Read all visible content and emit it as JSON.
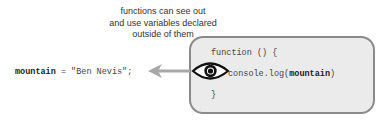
{
  "caption": {
    "line1": "functions can see out",
    "line2": "and use variables declared",
    "line3": "outside of them"
  },
  "outer": {
    "var_name": "mountain",
    "rest": " = \"Ben Nevis\";"
  },
  "function_box": {
    "header": "function () {",
    "body_prefix": "console.log(",
    "body_var": "mountain",
    "body_suffix": ")",
    "closing": "}"
  },
  "icons": {
    "eye": "eye-icon",
    "arrow": "arrow-left-icon"
  },
  "colors": {
    "box_fill": "#ebebeb",
    "box_border": "#8a8a8a",
    "arrow": "#a8a8a8",
    "eye": "#111111"
  }
}
